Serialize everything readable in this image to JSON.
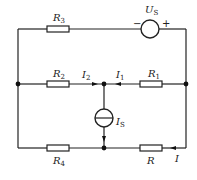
{
  "diagram": {
    "type": "circuit",
    "components": {
      "R3": {
        "symbol": "R",
        "sub": "3"
      },
      "Us": {
        "symbol": "U",
        "sub": "S",
        "minus": "−",
        "plus": "+"
      },
      "R2": {
        "symbol": "R",
        "sub": "2"
      },
      "R1": {
        "symbol": "R",
        "sub": "1"
      },
      "Is": {
        "symbol": "I",
        "sub": "S"
      },
      "R4": {
        "symbol": "R",
        "sub": "4"
      },
      "R": {
        "symbol": "R"
      }
    },
    "currents": {
      "I1": {
        "symbol": "I",
        "sub": "1"
      },
      "I2": {
        "symbol": "I",
        "sub": "2"
      },
      "I": {
        "symbol": "I"
      }
    },
    "colors": {
      "stroke": "#222222",
      "background": "#ffffff"
    }
  }
}
